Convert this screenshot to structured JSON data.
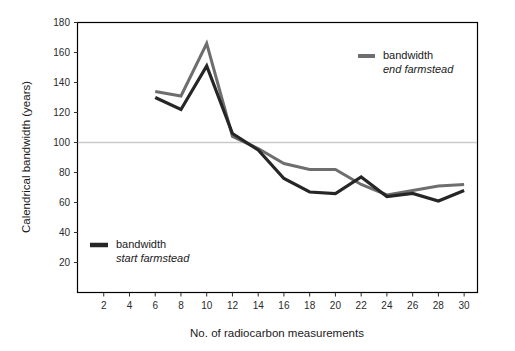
{
  "chart_data": {
    "type": "line",
    "title": "",
    "xlabel": "No. of radiocarbon measurements",
    "ylabel": "Calendrical bandwidth (years)",
    "xlim": [
      0,
      31
    ],
    "ylim": [
      0,
      180
    ],
    "xticks": [
      2,
      4,
      6,
      8,
      10,
      12,
      14,
      16,
      18,
      20,
      22,
      24,
      26,
      28,
      30
    ],
    "yticks": [
      20,
      40,
      60,
      80,
      100,
      120,
      140,
      160,
      180
    ],
    "grid": false,
    "reference_lines": [
      {
        "name": "hundred-year-line",
        "axis": "y",
        "value": 100,
        "color": "#c9c9c9"
      }
    ],
    "legend_position": "inside",
    "x": [
      6,
      8,
      10,
      12,
      14,
      16,
      18,
      20,
      22,
      24,
      26,
      28,
      30
    ],
    "series": [
      {
        "name": "bandwidth start farmstead",
        "label_line1": "bandwidth",
        "label_line2": "start farmstead",
        "color": "#262626",
        "values": [
          130,
          122,
          151,
          106,
          95,
          76,
          67,
          66,
          77,
          64,
          66,
          61,
          68
        ]
      },
      {
        "name": "bandwidth end farmstead",
        "label_line1": "bandwidth",
        "label_line2": "end farmstead",
        "color": "#6e6e6e",
        "values": [
          134,
          131,
          166,
          104,
          96,
          86,
          82,
          82,
          72,
          65,
          68,
          71,
          72
        ]
      }
    ]
  },
  "legend": {
    "end_farmstead": {
      "line1": "bandwidth",
      "line2": "end farmstead",
      "swatch_color": "#6e6e6e"
    },
    "start_farmstead": {
      "line1": "bandwidth",
      "line2": "start farmstead",
      "swatch_color": "#262626"
    }
  },
  "axes": {
    "x_title": "No. of radiocarbon measurements",
    "y_title": "Calendrical bandwidth (years)"
  }
}
